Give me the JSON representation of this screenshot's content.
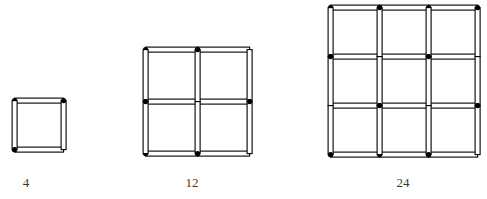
{
  "page": {
    "background_color": "#ffffff",
    "width": 487,
    "height": 199
  },
  "style": {
    "stick_outline_color": "#000000",
    "stick_fill_color": "#ffffff",
    "stick_head_color": "#000000",
    "label_color": "#3a3a3a",
    "stick_thickness": 5,
    "head_radius": 2.6,
    "outline_width": 1.1
  },
  "figures": [
    {
      "id": "figure-1",
      "grid_size": 1,
      "label": "4",
      "matchstick_count": 4,
      "origin_x": 15,
      "origin_y": 101,
      "cell_size": 49,
      "label_x": 26,
      "label_y": 176
    },
    {
      "id": "figure-2",
      "grid_size": 2,
      "label": "12",
      "matchstick_count": 12,
      "origin_x": 146,
      "origin_y": 50,
      "cell_size": 52,
      "label_x": 192,
      "label_y": 176
    },
    {
      "id": "figure-3",
      "grid_size": 3,
      "label": "24",
      "matchstick_count": 24,
      "origin_x": 331,
      "origin_y": 8,
      "cell_size": 49,
      "label_x": 403,
      "label_y": 176
    }
  ],
  "sequence": {
    "counts": [
      4,
      12,
      24
    ],
    "grid_sizes": [
      1,
      2,
      3
    ]
  }
}
